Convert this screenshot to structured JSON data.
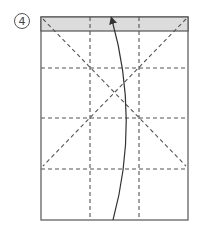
{
  "step": {
    "number": "4"
  },
  "diagram": {
    "type": "origami-fold-diagram",
    "paper": {
      "x": 41,
      "y": 17,
      "width": 147,
      "height": 203,
      "stroke": "#555555",
      "fill": "#ffffff"
    },
    "shaded_band": {
      "y": 17,
      "height": 14,
      "fill": "#dcdcdc"
    },
    "valley_folds": {
      "vertical_x": [
        90,
        139
      ],
      "horizontal_y": [
        68,
        118,
        169
      ],
      "diagonals": [
        {
          "from": [
            43,
            19
          ],
          "to": [
            186,
            166
          ]
        },
        {
          "from": [
            186,
            19
          ],
          "to": [
            43,
            166
          ]
        }
      ],
      "stroke": "#555555"
    },
    "arrow": {
      "from": [
        113,
        220
      ],
      "to": [
        112,
        19
      ],
      "bulge_x": 130,
      "stroke": "#333333"
    }
  }
}
